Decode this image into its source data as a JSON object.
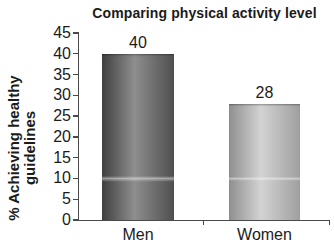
{
  "chart_data": {
    "type": "bar",
    "title": "Comparing physical activity level",
    "xlabel": "",
    "ylabel": "% Achieving healthy guidelines",
    "ylabel_lines": [
      "% Achieving healthy",
      "guidelines"
    ],
    "categories": [
      "Men",
      "Women"
    ],
    "values": [
      40,
      28
    ],
    "ylim": [
      0,
      45
    ],
    "ytick_step": 5,
    "yticks": [
      0,
      5,
      10,
      15,
      20,
      25,
      30,
      35,
      40,
      45
    ],
    "grid": false,
    "legend_position": "none",
    "value_labels_shown": true,
    "bar_colors": [
      {
        "edge_left": "#3f3f3f",
        "mid": "#8e8e8e",
        "edge_right": "#4f4f4f"
      },
      {
        "edge_left": "#8f8f8f",
        "mid": "#d3d3d3",
        "edge_right": "#9f9f9f"
      }
    ],
    "axis_color": "#4a4a4a",
    "text_color": "#1b1b1b",
    "background_color": "#ffffff"
  }
}
